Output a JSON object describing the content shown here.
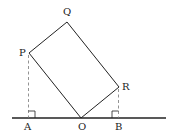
{
  "diagram": {
    "type": "geometry",
    "colors": {
      "line": "#222222",
      "dashed": "#777777",
      "background": "#ffffff"
    },
    "points": {
      "P": {
        "label": "P",
        "x": 29,
        "y": 53
      },
      "Q": {
        "label": "Q",
        "x": 67,
        "y": 22
      },
      "R": {
        "label": "R",
        "x": 119,
        "y": 87
      },
      "O": {
        "label": "O",
        "x": 81,
        "y": 118
      },
      "A": {
        "label": "A",
        "x": 28,
        "y": 118
      },
      "B": {
        "label": "B",
        "x": 118,
        "y": 118
      }
    },
    "baseline": {
      "x1": 12,
      "x2": 166,
      "y": 118
    },
    "shape": "rectangle OPQR",
    "perpendiculars": [
      "PA",
      "RB"
    ],
    "right_angle_markers": [
      "A",
      "B"
    ]
  }
}
